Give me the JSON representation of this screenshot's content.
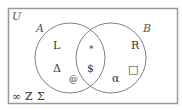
{
  "diagram": {
    "type": "venn",
    "colors": {
      "frame": "#9a9a9a",
      "circle": "#808080",
      "text": "#333333",
      "label": "#555555",
      "background": "#ffffff"
    },
    "universe": {
      "label": "U",
      "outside_elements": [
        "∞",
        "Z",
        "Σ"
      ]
    },
    "sets": [
      {
        "label": "A",
        "only_elements": [
          "L",
          "Δ",
          "@"
        ]
      },
      {
        "label": "B",
        "only_elements": [
          "R",
          "□",
          "α"
        ]
      }
    ],
    "intersection": {
      "elements": [
        "∗",
        "$"
      ]
    }
  }
}
